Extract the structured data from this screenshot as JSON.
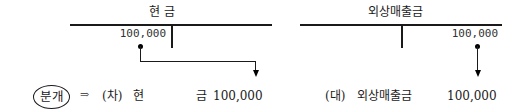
{
  "left_account": {
    "title": "현          금",
    "debit_amount": "100,000"
  },
  "right_account": {
    "title": "외상매출금",
    "credit_amount": "100,000"
  },
  "journal_entry": {
    "label": "분개",
    "arrow": "⇒",
    "debit_side": "(차)",
    "debit_account_part1": "현",
    "debit_account_part2": "금",
    "debit_amount": "100,000",
    "credit_side": "(대)",
    "credit_account": "외상매출금",
    "credit_amount": "100,000"
  }
}
